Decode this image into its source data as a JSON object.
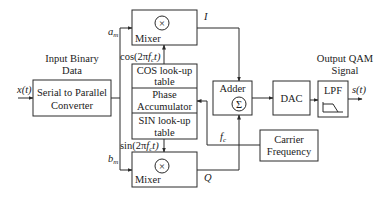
{
  "diagram": {
    "input": {
      "label_line1": "Input Binary",
      "label_line2": "Data",
      "signal": "x(t)"
    },
    "serial_to_parallel": {
      "line1": "Serial to Parallel",
      "line2": "Converter"
    },
    "branch_labels": {
      "upper": "a",
      "upper_sub": "m",
      "lower": "b",
      "lower_sub": "m"
    },
    "mixer_upper": {
      "label": "Mixer",
      "symbol": "×",
      "output": "I"
    },
    "mixer_lower": {
      "label": "Mixer",
      "symbol": "×",
      "output": "Q"
    },
    "cos_signal": {
      "prefix": "cos(2π",
      "f": "f",
      "sub": "c",
      "suffix": "t)"
    },
    "sin_signal": {
      "prefix": "sin(2π",
      "f": "f",
      "sub": "c",
      "suffix": "t)"
    },
    "nco_stack": {
      "cos_line1": "COS look-up",
      "cos_line2": "table",
      "phase_line1": "Phase",
      "phase_line2": "Accumulator",
      "sin_line1": "SIN look-up",
      "sin_line2": "table"
    },
    "adder": {
      "label": "Adder",
      "symbol": "Σ"
    },
    "dac": {
      "label": "DAC"
    },
    "lpf": {
      "label": "LPF"
    },
    "carrier": {
      "line1": "Carrier",
      "line2": "Frequency",
      "signal": "f",
      "signal_sub": "c"
    },
    "output": {
      "label_line1": "Output QAM",
      "label_line2": "Signal",
      "signal": "s(t)"
    }
  }
}
